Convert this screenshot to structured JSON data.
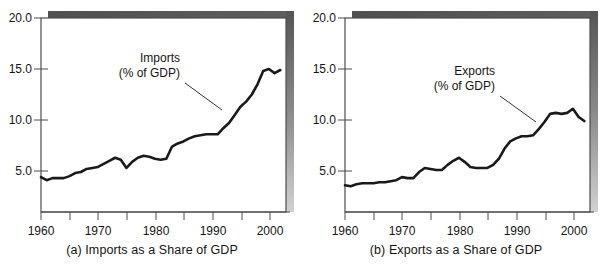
{
  "figure": {
    "background": "#ffffff",
    "line_color": "#1a1a1a",
    "frame_color": "#4d4d4d",
    "shadow_color_top": "#5a5a5a",
    "shadow_color_bottom": "#c9c9c9"
  },
  "panels": [
    {
      "id": "a",
      "caption": "(a) Imports as a Share of GDP",
      "annotation_line1": "Imports",
      "annotation_line2": "(% of GDP)"
    },
    {
      "id": "b",
      "caption": "(b) Exports as a Share of GDP",
      "annotation_line1": "Exports",
      "annotation_line2": "(% of GDP)"
    }
  ],
  "axis": {
    "y_tick_labels": [
      "20.0",
      "15.0",
      "10.0",
      "5.0"
    ],
    "y_tick_values": [
      20.0,
      15.0,
      10.0,
      5.0
    ],
    "x_tick_labels": [
      "1960",
      "1970",
      "1980",
      "1990",
      "2000"
    ],
    "x_tick_values": [
      1960,
      1970,
      1980,
      1990,
      2000
    ],
    "x_minor_ticks": [
      1965,
      1975,
      1985,
      1995
    ],
    "xlim": [
      1960,
      2003
    ],
    "ylim": [
      0,
      20
    ]
  },
  "chart_data": [
    {
      "type": "line",
      "title": "(a) Imports as a Share of GDP",
      "xlabel": "",
      "ylabel": "",
      "annotation": "Imports (% of GDP)",
      "grid": false,
      "legend": "none",
      "xlim": [
        1960,
        2003
      ],
      "ylim": [
        0,
        20
      ],
      "x": [
        1960,
        1961,
        1962,
        1963,
        1964,
        1965,
        1966,
        1967,
        1968,
        1969,
        1970,
        1971,
        1972,
        1973,
        1974,
        1975,
        1976,
        1977,
        1978,
        1979,
        1980,
        1981,
        1982,
        1983,
        1984,
        1985,
        1986,
        1987,
        1988,
        1989,
        1990,
        1991,
        1992,
        1993,
        1994,
        1995,
        1996,
        1997,
        1998,
        1999,
        2000,
        2001,
        2002
      ],
      "y": [
        4.4,
        4.1,
        4.3,
        4.3,
        4.3,
        4.5,
        4.8,
        4.9,
        5.2,
        5.3,
        5.4,
        5.7,
        6.0,
        6.3,
        6.1,
        5.3,
        5.9,
        6.3,
        6.5,
        6.4,
        6.2,
        6.1,
        6.2,
        7.4,
        7.7,
        7.9,
        8.2,
        8.4,
        8.5,
        8.6,
        8.6,
        8.6,
        9.2,
        9.7,
        10.5,
        11.3,
        11.8,
        12.5,
        13.5,
        14.8,
        15.0,
        14.6,
        14.9
      ]
    },
    {
      "type": "line",
      "title": "(b) Exports as a Share of GDP",
      "xlabel": "",
      "ylabel": "",
      "annotation": "Exports (% of GDP)",
      "grid": false,
      "legend": "none",
      "xlim": [
        1960,
        2003
      ],
      "ylim": [
        0,
        20
      ],
      "x": [
        1960,
        1961,
        1962,
        1963,
        1964,
        1965,
        1966,
        1967,
        1968,
        1969,
        1970,
        1971,
        1972,
        1973,
        1974,
        1975,
        1976,
        1977,
        1978,
        1979,
        1980,
        1981,
        1982,
        1983,
        1984,
        1985,
        1986,
        1987,
        1988,
        1989,
        1990,
        1991,
        1992,
        1993,
        1994,
        1995,
        1996,
        1997,
        1998,
        1999,
        2000,
        2001,
        2002
      ],
      "y": [
        3.6,
        3.5,
        3.7,
        3.8,
        3.8,
        3.8,
        3.9,
        3.9,
        4.0,
        4.1,
        4.4,
        4.3,
        4.3,
        4.9,
        5.3,
        5.2,
        5.1,
        5.1,
        5.6,
        6.0,
        6.3,
        5.9,
        5.4,
        5.3,
        5.3,
        5.3,
        5.6,
        6.2,
        7.2,
        7.9,
        8.2,
        8.4,
        8.4,
        8.5,
        9.1,
        9.8,
        10.6,
        10.7,
        10.6,
        10.7,
        11.1,
        10.3,
        9.9
      ]
    }
  ]
}
